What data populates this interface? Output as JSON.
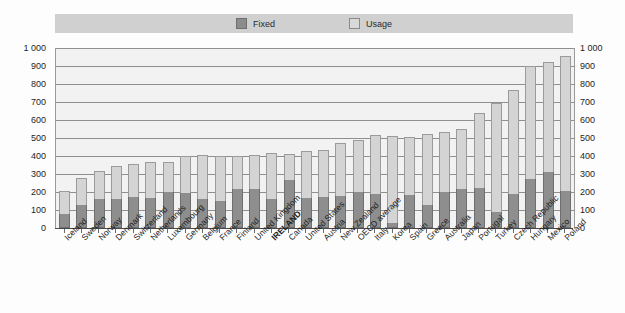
{
  "legend": {
    "items": [
      {
        "label": "Fixed",
        "color": "#8e8e8e",
        "icon": "square-swatch-icon"
      },
      {
        "label": "Usage",
        "color": "#d4d4d4",
        "icon": "square-swatch-icon"
      }
    ]
  },
  "axis": {
    "y_ticks": [
      "0",
      "100",
      "200",
      "300",
      "400",
      "500",
      "600",
      "700",
      "800",
      "900",
      "1 000"
    ],
    "y_min": 0,
    "y_max": 1000,
    "y_step": 100
  },
  "chart_data": {
    "type": "bar",
    "stacked": true,
    "title": "",
    "subtitle": "",
    "xlabel": "",
    "ylabel": "",
    "ylim": [
      0,
      1000
    ],
    "grid": true,
    "legend_position": "top",
    "dual_y_axis": true,
    "highlight_category": "IRELAND",
    "categories": [
      "Iceland",
      "Sweden",
      "Norway",
      "Denmark",
      "Switzerland",
      "Netherlands",
      "Luxembourg",
      "Germany",
      "Belgium",
      "France",
      "Finland",
      "United Kingdom",
      "IRELAND",
      "Canada",
      "United States",
      "Austria",
      "New Zealand",
      "OECD average",
      "Italy",
      "Korea",
      "Spain",
      "Greece",
      "Australia",
      "Japan",
      "Portugal",
      "Turkey",
      "Czech Republic",
      "Hungary",
      "Mexico",
      "Poland"
    ],
    "series": [
      {
        "name": "Fixed",
        "color": "#8e8e8e",
        "values": [
          80,
          130,
          160,
          160,
          170,
          165,
          200,
          195,
          160,
          150,
          215,
          215,
          160,
          265,
          165,
          170,
          180,
          200,
          190,
          30,
          185,
          130,
          200,
          215,
          225,
          90,
          190,
          275,
          310,
          205
        ]
      },
      {
        "name": "Usage",
        "color": "#d4d4d4",
        "values": [
          125,
          150,
          155,
          185,
          185,
          200,
          165,
          205,
          245,
          250,
          185,
          190,
          255,
          145,
          265,
          265,
          290,
          290,
          325,
          480,
          320,
          390,
          335,
          335,
          415,
          605,
          575,
          625,
          610,
          750
        ]
      }
    ],
    "totals": [
      205,
      280,
      315,
      345,
      355,
      365,
      365,
      400,
      405,
      400,
      400,
      405,
      415,
      410,
      430,
      435,
      470,
      490,
      515,
      510,
      505,
      520,
      535,
      550,
      640,
      695,
      765,
      900,
      920,
      955
    ]
  }
}
